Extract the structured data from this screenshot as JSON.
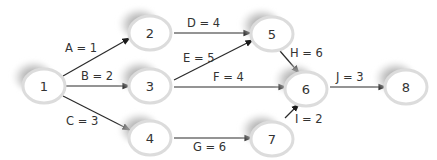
{
  "diagram": {
    "type": "activity-on-node network",
    "colors": {
      "edge": "#2a2a2a",
      "node_fill": "#ffffff",
      "node_ring": "#dcdcdc",
      "node_shadow": "#9a9a9a",
      "text": "#333333"
    },
    "nodes": [
      {
        "id": "1",
        "label": "1",
        "cx": 44,
        "cy": 86
      },
      {
        "id": "2",
        "label": "2",
        "cx": 150,
        "cy": 33
      },
      {
        "id": "3",
        "label": "3",
        "cx": 150,
        "cy": 86
      },
      {
        "id": "4",
        "label": "4",
        "cx": 150,
        "cy": 138
      },
      {
        "id": "5",
        "label": "5",
        "cx": 272,
        "cy": 34
      },
      {
        "id": "6",
        "label": "6",
        "cx": 306,
        "cy": 89
      },
      {
        "id": "7",
        "label": "7",
        "cx": 272,
        "cy": 139
      },
      {
        "id": "8",
        "label": "8",
        "cx": 406,
        "cy": 87
      }
    ],
    "edges": [
      {
        "id": "A",
        "from": "1",
        "to": "2",
        "label": "A = 1"
      },
      {
        "id": "B",
        "from": "1",
        "to": "3",
        "label": "B = 2"
      },
      {
        "id": "C",
        "from": "1",
        "to": "4",
        "label": "C = 3"
      },
      {
        "id": "D",
        "from": "2",
        "to": "5",
        "label": "D = 4"
      },
      {
        "id": "E",
        "from": "3",
        "to": "5",
        "label": "E = 5"
      },
      {
        "id": "F",
        "from": "3",
        "to": "6",
        "label": "F = 4"
      },
      {
        "id": "G",
        "from": "4",
        "to": "7",
        "label": "G = 6"
      },
      {
        "id": "H",
        "from": "5",
        "to": "6",
        "label": "H = 6"
      },
      {
        "id": "I",
        "from": "7",
        "to": "6",
        "label": "I = 2"
      },
      {
        "id": "J",
        "from": "6",
        "to": "8",
        "label": "J = 3"
      }
    ]
  }
}
